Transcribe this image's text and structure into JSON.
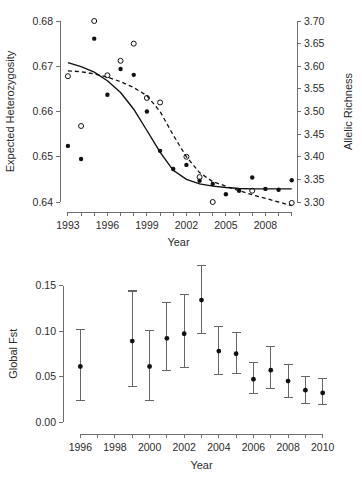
{
  "figure": {
    "background": "#ffffff",
    "point_color": "#111111",
    "axis_color": "#6e6e6e",
    "errorbar_color": "#666666",
    "highlight_red": "#e8b4b8",
    "highlight_teal": "#7fb3a8"
  },
  "chart_data": [
    {
      "id": "top",
      "type": "scatter",
      "title": "",
      "xlabel": "Year",
      "ylabel": "Expected Heterozygosity",
      "y2label": "Allelic Richness",
      "xlim": [
        1992.4,
        2010.4
      ],
      "ylim": [
        0.64,
        0.68
      ],
      "y2lim": [
        3.3,
        3.7
      ],
      "grid": false,
      "legend": "none",
      "xticks": [
        1993,
        1996,
        1999,
        2002,
        2005,
        2008
      ],
      "xticklabels": [
        "1993",
        "1996",
        "1999",
        "2002",
        "2005",
        "2008"
      ],
      "xminorticks": [
        1993,
        1994,
        1995,
        1996,
        1997,
        1998,
        1999,
        2000,
        2001,
        2002,
        2003,
        2004,
        2005,
        2006,
        2007,
        2008,
        2009,
        2010
      ],
      "yticks": [
        0.64,
        0.65,
        0.66,
        0.67,
        0.68
      ],
      "yticklabels": [
        "0.64",
        "0.65",
        "0.66",
        "0.67",
        "0.68"
      ],
      "y2ticks": [
        3.3,
        3.35,
        3.4,
        3.45,
        3.5,
        3.55,
        3.6,
        3.65,
        3.7
      ],
      "y2ticklabels": [
        "3.30",
        "3.35",
        "3.40",
        "3.45",
        "3.50",
        "3.55",
        "3.60",
        "3.65",
        "3.70"
      ],
      "series": [
        {
          "name": "Expected Heterozygosity",
          "marker": "filled-circle",
          "axis": "left",
          "x": [
            1993,
            1994,
            1995,
            1996,
            1997,
            1998,
            1999,
            2000,
            2001,
            2002,
            2003,
            2004,
            2005,
            2006,
            2007,
            2008,
            2009,
            2010
          ],
          "y": [
            0.6524,
            0.6495,
            0.6761,
            0.6637,
            0.6694,
            0.6681,
            0.66,
            0.6513,
            0.6473,
            0.6482,
            0.6447,
            0.644,
            0.6417,
            0.6425,
            0.6454,
            0.6429,
            0.6427,
            0.6448
          ]
        },
        {
          "name": "Allelic Richness",
          "marker": "open-circle",
          "axis": "right",
          "x": [
            1993,
            1994,
            1995,
            1996,
            1997,
            1998,
            1999,
            2000,
            2002,
            2003,
            2004,
            2007,
            2010
          ],
          "y": [
            3.578,
            3.468,
            3.7,
            3.58,
            3.612,
            3.65,
            3.53,
            3.52,
            3.4,
            3.355,
            3.3,
            3.325,
            3.298
          ]
        }
      ],
      "trendlines": [
        {
          "name": "heterozygosity-trend",
          "style": "solid",
          "axis": "left",
          "x": [
            1993.0,
            1994.0,
            1995.0,
            1996.0,
            1997.0,
            1998.0,
            1999.0,
            2000.0,
            2001.0,
            2002.0,
            2003.0,
            2004.0,
            2005.0,
            2006.0,
            2007.0,
            2008.0,
            2009.0,
            2010.0
          ],
          "y": [
            0.6708,
            0.6699,
            0.6687,
            0.6668,
            0.6642,
            0.6605,
            0.6558,
            0.651,
            0.647,
            0.645,
            0.644,
            0.6435,
            0.6432,
            0.643,
            0.6429,
            0.6429,
            0.6429,
            0.6429
          ]
        },
        {
          "name": "allelic-richness-trend",
          "style": "dashed",
          "axis": "right",
          "x": [
            1993.0,
            1994.0,
            1995.0,
            1996.0,
            1997.0,
            1998.0,
            1999.0,
            2000.0,
            2001.0,
            2002.0,
            2003.0,
            2004.0,
            2005.0,
            2006.0,
            2007.0,
            2008.0,
            2009.0,
            2010.0
          ],
          "y": [
            3.59,
            3.588,
            3.583,
            3.576,
            3.566,
            3.553,
            3.535,
            3.5,
            3.448,
            3.4,
            3.365,
            3.345,
            3.335,
            3.325,
            3.316,
            3.308,
            3.3,
            3.292
          ]
        }
      ]
    },
    {
      "id": "bottom",
      "type": "errorbar",
      "title": "",
      "xlabel": "Year",
      "ylabel": "Global Fst",
      "xlim": [
        1995.0,
        2011.0
      ],
      "ylim": [
        0.0,
        0.155
      ],
      "grid": false,
      "legend": "none",
      "xticks": [
        1996,
        1998,
        2000,
        2002,
        2004,
        2006,
        2008,
        2010
      ],
      "xticklabels": [
        "1996",
        "1998",
        "2000",
        "2002",
        "2004",
        "2006",
        "2008",
        "2010"
      ],
      "xminorticks": [
        1996,
        1997,
        1998,
        1999,
        2000,
        2001,
        2002,
        2003,
        2004,
        2005,
        2006,
        2007,
        2008,
        2009,
        2010
      ],
      "yticks": [
        0.0,
        0.05,
        0.1,
        0.15
      ],
      "yticklabels": [
        "0.00",
        "0.05",
        "0.10",
        "0.15"
      ],
      "points": [
        {
          "x": 1996,
          "y": 0.061,
          "lo": 0.024,
          "hi": 0.102,
          "cap_color": "#e8b4b8"
        },
        {
          "x": 1999,
          "y": 0.089,
          "lo": 0.039,
          "hi": 0.144,
          "cap_color": "#666666"
        },
        {
          "x": 2000,
          "y": 0.061,
          "lo": 0.024,
          "hi": 0.101,
          "cap_color": "#666666"
        },
        {
          "x": 2001,
          "y": 0.092,
          "lo": 0.057,
          "hi": 0.131,
          "cap_color": "#666666"
        },
        {
          "x": 2002,
          "y": 0.097,
          "lo": 0.06,
          "hi": 0.14,
          "cap_color": "#666666"
        },
        {
          "x": 2003,
          "y": 0.134,
          "lo": 0.097,
          "hi": 0.172,
          "cap_color": "#666666"
        },
        {
          "x": 2004,
          "y": 0.078,
          "lo": 0.052,
          "hi": 0.105,
          "cap_color": "#666666"
        },
        {
          "x": 2005,
          "y": 0.075,
          "lo": 0.053,
          "hi": 0.098,
          "cap_color": "#666666"
        },
        {
          "x": 2006,
          "y": 0.047,
          "lo": 0.031,
          "hi": 0.065,
          "cap_color": "#666666"
        },
        {
          "x": 2007,
          "y": 0.057,
          "lo": 0.037,
          "hi": 0.083,
          "cap_color": "#7fb3a8"
        },
        {
          "x": 2008,
          "y": 0.045,
          "lo": 0.027,
          "hi": 0.063,
          "cap_color": "#7fb3a8"
        },
        {
          "x": 2009,
          "y": 0.035,
          "lo": 0.02,
          "hi": 0.05,
          "cap_color": "#666666"
        },
        {
          "x": 2010,
          "y": 0.032,
          "lo": 0.019,
          "hi": 0.048,
          "cap_color": "#666666"
        }
      ]
    }
  ]
}
